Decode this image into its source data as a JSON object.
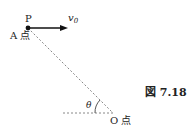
{
  "diagram": {
    "point_label": "P",
    "start_label": "A 点",
    "end_label": "O 点",
    "velocity_label": "v",
    "velocity_subscript": "0",
    "angle_label": "θ",
    "figure_caption": "図 7.18"
  }
}
